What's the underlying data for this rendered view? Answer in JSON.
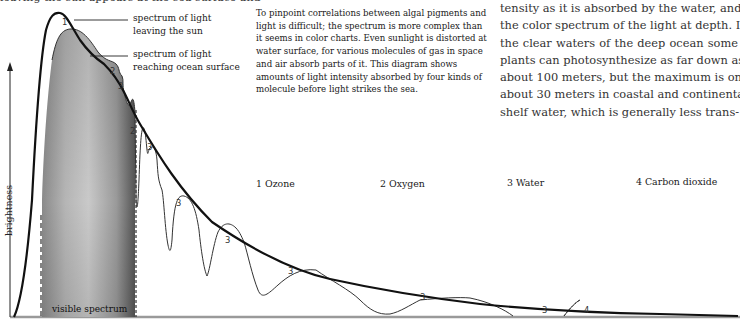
{
  "header": {
    "cut_off_text": "leaving the sun appears at the sea surface and"
  },
  "caption": "To pinpoint correlations between algal pigments and light is difficult; the spectrum is more complex than it seems in color charts. Even sunlight is distorted at water surface, for various molecules of gas in space and air absorb parts of it. This diagram shows amounts of light intensity absorbed by four kinds of molecule before light strikes the sea.",
  "body_text": {
    "lines": [
      "tensity as it is absorbed by the water, and",
      "the color spectrum of the light at depth. In",
      "the clear waters of the deep ocean some",
      "plants can photosynthesize as far down as",
      "about 100 meters, but the maximum is only",
      "about 30 meters in coastal and continental-",
      "shelf water, which is generally less trans-"
    ]
  },
  "chart": {
    "y_axis_label": "brightness",
    "y_axis_arrow": "arrow-up-icon",
    "curve_labels": {
      "outer": "spectrum of light leaving the sun",
      "outer_line1": "spectrum of light",
      "outer_line2": "leaving the sun",
      "inner_line1": "spectrum of light",
      "inner_line2": "reaching ocean surface"
    },
    "visible_band_label": "visible spectrum",
    "legend": [
      {
        "num": "1",
        "name": "Ozone",
        "text": "1 Ozone"
      },
      {
        "num": "2",
        "name": "Oxygen",
        "text": "2 Oxygen"
      },
      {
        "num": "3",
        "name": "Water",
        "text": "3 Water"
      },
      {
        "num": "4",
        "name": "Carbon dioxide",
        "text": "4 Carbon dioxide"
      }
    ],
    "absorption_markers": [
      "1",
      "2",
      "3",
      "2",
      "3",
      "3",
      "3",
      "3",
      "3",
      "3",
      "4"
    ],
    "colors": {
      "outer_curve": "#111111",
      "inner_curve": "#333333",
      "visible_fill_dark": "#6e6e6e",
      "visible_fill_light": "#cfcfcf",
      "axis": "#888888"
    }
  }
}
